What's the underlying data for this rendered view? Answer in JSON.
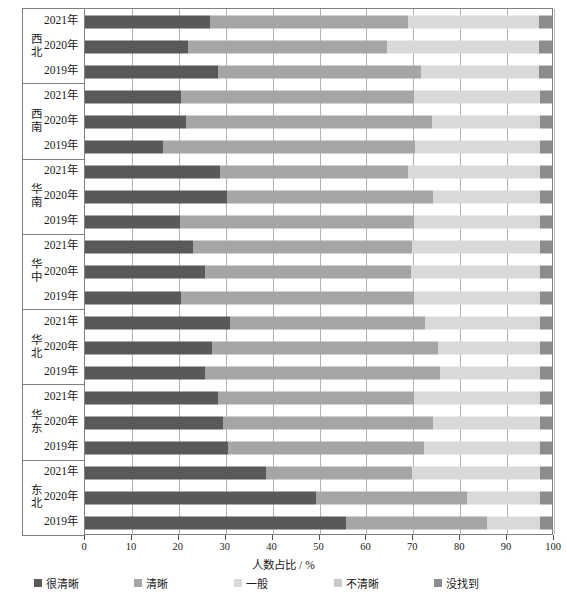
{
  "chart_data": {
    "type": "bar",
    "orientation": "horizontal",
    "stacked": true,
    "stacked_normalized": true,
    "title": "",
    "xlabel": "人数占比 / %",
    "ylabel": "",
    "xlim": [
      0,
      100
    ],
    "xticks": [
      0,
      10,
      20,
      30,
      40,
      50,
      60,
      70,
      80,
      90,
      100
    ],
    "xtick_labels": [
      "0",
      "10",
      "20",
      "30",
      "40",
      "50",
      "60",
      "70",
      "80",
      "90",
      "100"
    ],
    "grid": true,
    "grid_axis": "x",
    "legend_position": "bottom",
    "series": [
      {
        "name": "很清晰",
        "color": "#595959"
      },
      {
        "name": "清晰",
        "color": "#a6a6a6"
      },
      {
        "name": "一般",
        "color": "#d9d9d9"
      },
      {
        "name": "不清晰",
        "color": "#c9c9c9"
      },
      {
        "name": "没找到",
        "color": "#8c8c8c"
      }
    ],
    "groups": [
      {
        "region": "西北",
        "rows": [
          {
            "year": "2021年",
            "values": [
              26.7,
              42.4,
              28.1,
              0.0,
              2.8
            ]
          },
          {
            "year": "2020年",
            "values": [
              22.0,
              42.6,
              32.6,
              0.0,
              2.8
            ]
          },
          {
            "year": "2019年",
            "values": [
              28.4,
              43.6,
              25.2,
              0.0,
              2.8
            ]
          }
        ]
      },
      {
        "region": "西南",
        "rows": [
          {
            "year": "2021年",
            "values": [
              20.5,
              49.9,
              27.0,
              0.0,
              2.6
            ]
          },
          {
            "year": "2020年",
            "values": [
              21.7,
              52.6,
              23.1,
              0.0,
              2.6
            ]
          },
          {
            "year": "2019年",
            "values": [
              16.6,
              54.1,
              26.7,
              0.0,
              2.6
            ]
          }
        ]
      },
      {
        "region": "华南",
        "rows": [
          {
            "year": "2021年",
            "values": [
              29.0,
              40.1,
              28.3,
              0.0,
              2.6
            ]
          },
          {
            "year": "2020年",
            "values": [
              30.4,
              44.2,
              22.8,
              0.0,
              2.6
            ]
          },
          {
            "year": "2019年",
            "values": [
              20.4,
              50.0,
              27.0,
              0.0,
              2.6
            ]
          }
        ]
      },
      {
        "region": "华中",
        "rows": [
          {
            "year": "2021年",
            "values": [
              23.1,
              46.9,
              27.4,
              0.0,
              2.6
            ]
          },
          {
            "year": "2020年",
            "values": [
              25.7,
              44.0,
              27.7,
              0.0,
              2.6
            ]
          },
          {
            "year": "2019年",
            "values": [
              20.6,
              49.8,
              27.0,
              0.0,
              2.6
            ]
          }
        ]
      },
      {
        "region": "华北",
        "rows": [
          {
            "year": "2021年",
            "values": [
              31.1,
              41.7,
              24.6,
              0.0,
              2.6
            ]
          },
          {
            "year": "2020年",
            "values": [
              27.2,
              48.4,
              21.8,
              0.0,
              2.6
            ]
          },
          {
            "year": "2019年",
            "values": [
              25.6,
              50.4,
              21.4,
              0.0,
              2.6
            ]
          }
        ]
      },
      {
        "region": "华东",
        "rows": [
          {
            "year": "2021年",
            "values": [
              28.4,
              42.0,
              27.0,
              0.0,
              2.6
            ]
          },
          {
            "year": "2020年",
            "values": [
              29.6,
              45.0,
              22.8,
              0.0,
              2.6
            ]
          },
          {
            "year": "2019年",
            "values": [
              30.7,
              41.8,
              24.9,
              0.0,
              2.6
            ]
          }
        ]
      },
      {
        "region": "东北",
        "rows": [
          {
            "year": "2021年",
            "values": [
              38.7,
              31.3,
              27.4,
              0.0,
              2.6
            ]
          },
          {
            "year": "2020年",
            "values": [
              49.4,
              32.3,
              15.7,
              0.0,
              2.6
            ]
          },
          {
            "year": "2019年",
            "values": [
              55.8,
              30.2,
              11.4,
              0.0,
              2.6
            ]
          }
        ]
      }
    ]
  }
}
